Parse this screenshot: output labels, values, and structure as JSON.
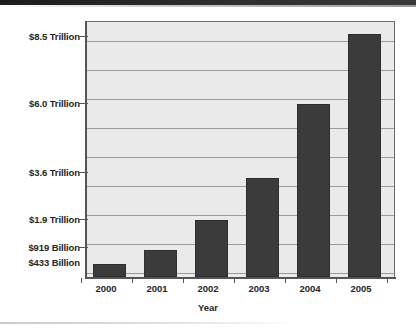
{
  "chart_data": {
    "type": "bar",
    "title": "",
    "subtitle": "",
    "xlabel": "Year",
    "ylabel": "",
    "categories": [
      "2000",
      "2001",
      "2002",
      "2003",
      "2004",
      "2005"
    ],
    "values": [
      433,
      919,
      1900,
      3600,
      6000,
      8500
    ],
    "value_labels": [
      "$433 Billion",
      "$919 Billion",
      "$1.9 Trillion",
      "$3.6 Trillion",
      "$6.0 Trillion",
      "$8.5 Trillion"
    ],
    "value_unit": "billions of US dollars",
    "ylim": [
      0,
      8900
    ],
    "ytick_values": [
      433,
      919,
      1900,
      3600,
      6000,
      8500
    ],
    "ytick_labels": [
      "$433 Billion",
      "$919 Billion",
      "$1.9 Trillion",
      "$3.6 Trillion",
      "$6.0 Trillion",
      "$8.5 Trillion"
    ],
    "xtick_labels": [
      "2000",
      "2001",
      "2002",
      "2003",
      "2004",
      "2005"
    ],
    "grid": true,
    "grid_orientation": "horizontal",
    "legend": false,
    "legend_position": "none",
    "series": [
      {
        "name": "Value",
        "values": [
          433,
          919,
          1900,
          3600,
          6000,
          8500
        ]
      }
    ],
    "colors": {
      "bar": "#3b3b3b",
      "panel_background": "#eaeaea",
      "gridline": "#9b9b9b",
      "axis": "#555555",
      "text": "#262626",
      "page_background": "#ffffff"
    }
  },
  "axis": {
    "y_labels": [
      {
        "text": "$8.5 Trillion",
        "y": 31,
        "tick": true
      },
      {
        "text": "$6.0 Trillion",
        "y": 98,
        "tick": true
      },
      {
        "text": "$3.6 Trillion",
        "y": 167,
        "tick": true
      },
      {
        "text": "$1.9 Trillion",
        "y": 214,
        "tick": true
      },
      {
        "text": "$919 Billion",
        "y": 242,
        "tick": true
      },
      {
        "text": "$433 Billion",
        "y": 257,
        "tick": false
      }
    ],
    "x_labels": [
      {
        "text": "2000",
        "x": 106
      },
      {
        "text": "2001",
        "x": 157
      },
      {
        "text": "2002",
        "x": 208
      },
      {
        "text": "2003",
        "x": 259
      },
      {
        "text": "2004",
        "x": 310
      },
      {
        "text": "2005",
        "x": 361
      }
    ],
    "x_title": "Year"
  },
  "bars": [
    {
      "label": "2000",
      "left": 8,
      "width": 33,
      "height": 13
    },
    {
      "label": "2001",
      "left": 59,
      "width": 33,
      "height": 27
    },
    {
      "label": "2002",
      "left": 110,
      "width": 33,
      "height": 57
    },
    {
      "label": "2003",
      "left": 161,
      "width": 33,
      "height": 99
    },
    {
      "label": "2004",
      "left": 212,
      "width": 33,
      "height": 173
    },
    {
      "label": "2005",
      "left": 263,
      "width": 33,
      "height": 243
    }
  ],
  "gridlines": [
    {
      "y": 19
    },
    {
      "y": 48
    },
    {
      "y": 77
    },
    {
      "y": 106
    },
    {
      "y": 135
    },
    {
      "y": 164
    },
    {
      "y": 193
    },
    {
      "y": 222
    },
    {
      "y": 251
    }
  ]
}
